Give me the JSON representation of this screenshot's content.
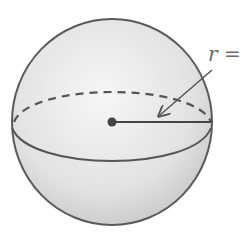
{
  "figure": {
    "type": "sphere",
    "labels": {
      "radius_symbol": "r",
      "equals": "="
    },
    "colors": {
      "outline": "#555555",
      "fill_light": "#f4f4f4",
      "fill_dark": "#c8c8c8",
      "line": "#444444"
    }
  }
}
